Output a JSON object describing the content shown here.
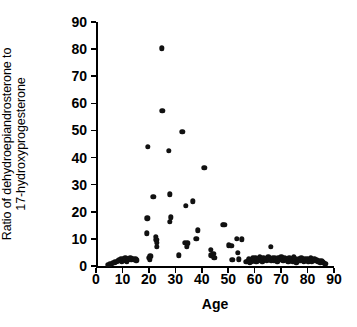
{
  "chart_data": {
    "type": "scatter",
    "title": "",
    "xlabel": "Age",
    "ylabel": "Ratio of dehydroepiandrosterone to 17-hydroxyprogesterone",
    "ylabel_lines": [
      "Ratio of dehydroepiandrosterone to",
      "17-hydroxyprogesterone"
    ],
    "xlim": [
      0,
      90
    ],
    "ylim": [
      0,
      90
    ],
    "xticks": [
      0,
      10,
      20,
      30,
      40,
      50,
      60,
      70,
      80,
      90
    ],
    "yticks": [
      0,
      10,
      20,
      30,
      40,
      50,
      60,
      70,
      80,
      90
    ],
    "xticklabels": [
      "0",
      "10",
      "20",
      "30",
      "40",
      "50",
      "60",
      "70",
      "80",
      "90"
    ],
    "yticklabels": [
      "0",
      "10",
      "20",
      "30",
      "40",
      "50",
      "60",
      "70",
      "80",
      "90"
    ],
    "grid": false,
    "legend": null,
    "marker": "filled-circle",
    "marker_color": "#111111",
    "points": [
      [
        4.5,
        0.5
      ],
      [
        5.2,
        0.6
      ],
      [
        6.0,
        0.9
      ],
      [
        6.6,
        1.1
      ],
      [
        7.2,
        1.3
      ],
      [
        7.8,
        1.5
      ],
      [
        8.3,
        1.9
      ],
      [
        8.8,
        2.1
      ],
      [
        9.3,
        2.4
      ],
      [
        9.8,
        1.7
      ],
      [
        10.2,
        2.6
      ],
      [
        10.6,
        2.0
      ],
      [
        11.1,
        2.8
      ],
      [
        11.6,
        1.6
      ],
      [
        12.0,
        2.5
      ],
      [
        12.5,
        2.2
      ],
      [
        13.0,
        2.9
      ],
      [
        13.4,
        2.4
      ],
      [
        13.9,
        2.7
      ],
      [
        14.3,
        2.3
      ],
      [
        14.8,
        2.6
      ],
      [
        15.2,
        2.1
      ],
      [
        19.2,
        12.0
      ],
      [
        19.4,
        17.6
      ],
      [
        19.6,
        44.0
      ],
      [
        20.0,
        3.0
      ],
      [
        20.3,
        2.2
      ],
      [
        20.6,
        3.6
      ],
      [
        21.7,
        25.6
      ],
      [
        22.6,
        10.7
      ],
      [
        22.8,
        9.6
      ],
      [
        22.9,
        7.0
      ],
      [
        23.0,
        8.6
      ],
      [
        24.9,
        80.3
      ],
      [
        25.0,
        57.2
      ],
      [
        27.6,
        42.4
      ],
      [
        27.9,
        26.4
      ],
      [
        28.0,
        16.2
      ],
      [
        28.3,
        18.0
      ],
      [
        31.3,
        4.0
      ],
      [
        32.7,
        49.5
      ],
      [
        33.5,
        8.6
      ],
      [
        34.0,
        22.1
      ],
      [
        34.4,
        7.0
      ],
      [
        34.6,
        8.4
      ],
      [
        36.6,
        23.8
      ],
      [
        38.0,
        10.1
      ],
      [
        38.6,
        13.1
      ],
      [
        40.9,
        36.3
      ],
      [
        43.4,
        5.9
      ],
      [
        43.6,
        4.0
      ],
      [
        44.4,
        4.6
      ],
      [
        44.8,
        3.0
      ],
      [
        47.9,
        15.3
      ],
      [
        48.5,
        15.1
      ],
      [
        50.3,
        7.6
      ],
      [
        51.1,
        7.5
      ],
      [
        51.6,
        2.2
      ],
      [
        53.3,
        10.0
      ],
      [
        53.6,
        4.9
      ],
      [
        54.1,
        2.4
      ],
      [
        55.2,
        9.9
      ],
      [
        56.9,
        1.6
      ],
      [
        57.4,
        1.9
      ],
      [
        57.8,
        2.4
      ],
      [
        58.2,
        1.4
      ],
      [
        58.6,
        2.1
      ],
      [
        59.0,
        1.7
      ],
      [
        59.4,
        2.9
      ],
      [
        59.8,
        2.2
      ],
      [
        60.2,
        3.1
      ],
      [
        60.6,
        1.5
      ],
      [
        61.0,
        2.6
      ],
      [
        61.5,
        2.0
      ],
      [
        62.0,
        3.3
      ],
      [
        62.4,
        2.4
      ],
      [
        62.9,
        1.8
      ],
      [
        63.3,
        3.0
      ],
      [
        63.8,
        2.3
      ],
      [
        64.2,
        2.7
      ],
      [
        64.7,
        1.9
      ],
      [
        65.1,
        3.2
      ],
      [
        65.6,
        2.5
      ],
      [
        66.0,
        7.0
      ],
      [
        66.3,
        2.1
      ],
      [
        66.8,
        2.8
      ],
      [
        67.2,
        2.0
      ],
      [
        67.7,
        3.1
      ],
      [
        68.1,
        2.4
      ],
      [
        68.6,
        1.7
      ],
      [
        69.0,
        2.9
      ],
      [
        69.5,
        2.2
      ],
      [
        70.0,
        3.4
      ],
      [
        70.4,
        2.6
      ],
      [
        70.9,
        1.9
      ],
      [
        71.3,
        3.0
      ],
      [
        71.8,
        2.3
      ],
      [
        72.2,
        2.7
      ],
      [
        72.7,
        1.6
      ],
      [
        73.1,
        2.9
      ],
      [
        73.6,
        2.1
      ],
      [
        74.0,
        2.5
      ],
      [
        74.5,
        1.8
      ],
      [
        74.9,
        3.2
      ],
      [
        75.4,
        2.4
      ],
      [
        75.8,
        1.4
      ],
      [
        76.3,
        2.0
      ],
      [
        76.7,
        2.6
      ],
      [
        77.2,
        1.9
      ],
      [
        77.6,
        2.8
      ],
      [
        78.1,
        2.2
      ],
      [
        78.5,
        1.6
      ],
      [
        79.0,
        2.4
      ],
      [
        79.4,
        2.0
      ],
      [
        79.9,
        2.7
      ],
      [
        80.3,
        1.8
      ],
      [
        80.8,
        2.3
      ],
      [
        81.2,
        2.9
      ],
      [
        81.7,
        1.5
      ],
      [
        82.1,
        2.1
      ],
      [
        82.6,
        2.5
      ],
      [
        83.0,
        1.9
      ],
      [
        83.5,
        2.2
      ],
      [
        83.9,
        1.6
      ],
      [
        84.4,
        2.0
      ],
      [
        84.8,
        1.3
      ],
      [
        85.3,
        1.8
      ],
      [
        85.7,
        1.4
      ],
      [
        86.2,
        1.1
      ],
      [
        86.6,
        0.9
      ],
      [
        87.0,
        0.7
      ]
    ]
  }
}
